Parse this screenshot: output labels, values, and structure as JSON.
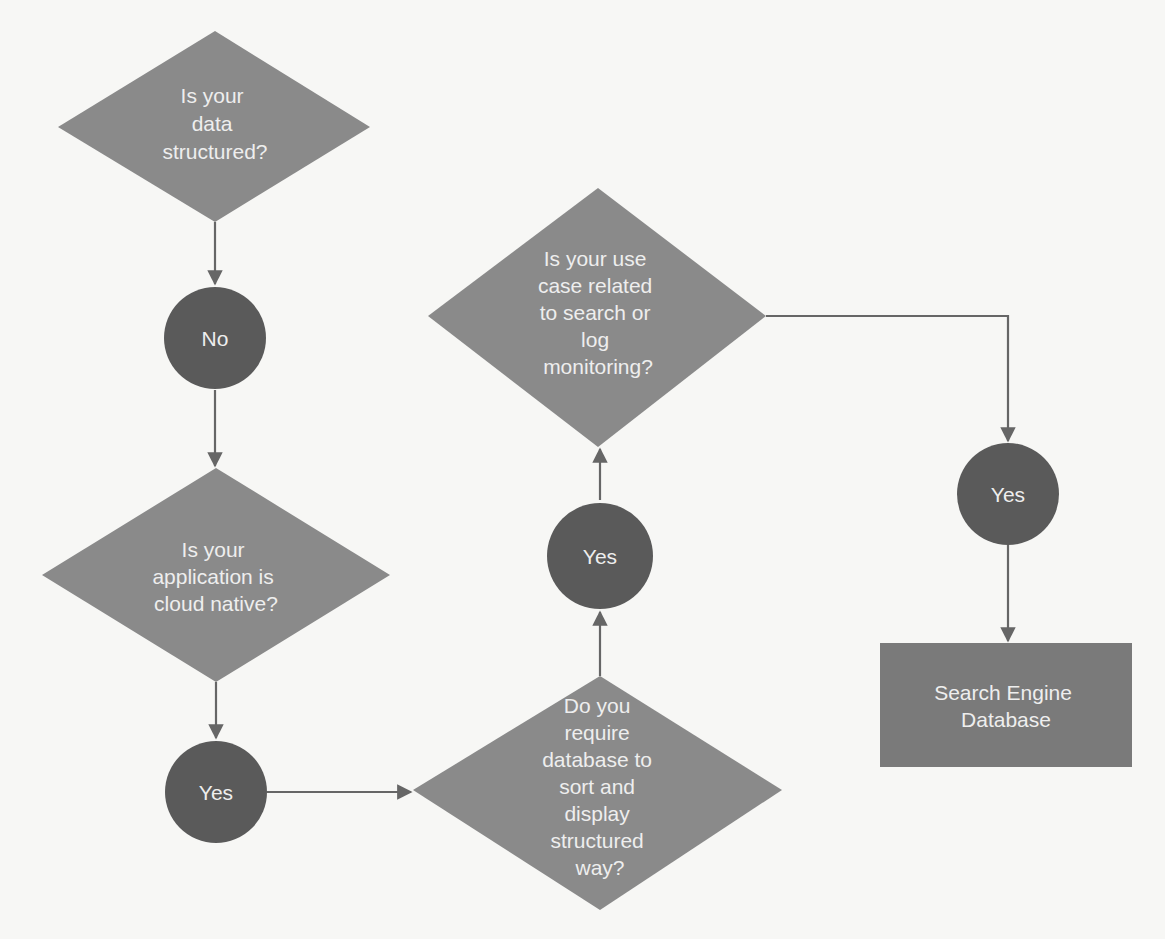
{
  "diagram": {
    "title": "",
    "colors": {
      "decision_fill": "#8a8a8a",
      "answer_fill": "#5a5a5a",
      "result_fill": "#7a7a7a",
      "connector": "#666666",
      "text": "#eeeeee",
      "background": "#f7f7f5"
    },
    "nodes": {
      "q_structured": {
        "type": "decision",
        "lines": [
          "Is your",
          "data",
          "structured?"
        ]
      },
      "a_no": {
        "type": "answer",
        "label": "No"
      },
      "q_cloud_native": {
        "type": "decision",
        "lines": [
          "Is your",
          "application is",
          "cloud native?"
        ]
      },
      "a_yes_cloud": {
        "type": "answer",
        "label": "Yes"
      },
      "q_sort_display": {
        "type": "decision",
        "lines": [
          "Do you",
          "require",
          "database to",
          "sort and",
          "display",
          "structured",
          "way?"
        ]
      },
      "a_yes_sort": {
        "type": "answer",
        "label": "Yes"
      },
      "q_search_log": {
        "type": "decision",
        "lines": [
          "Is your use",
          "case related",
          "to search or",
          "log",
          "monitoring?"
        ]
      },
      "a_yes_search": {
        "type": "answer",
        "label": "Yes"
      },
      "r_search_engine": {
        "type": "result",
        "lines": [
          "Search Engine",
          "Database"
        ]
      }
    },
    "edges": [
      {
        "from": "q_structured",
        "to": "a_no"
      },
      {
        "from": "a_no",
        "to": "q_cloud_native"
      },
      {
        "from": "q_cloud_native",
        "to": "a_yes_cloud"
      },
      {
        "from": "a_yes_cloud",
        "to": "q_sort_display"
      },
      {
        "from": "q_sort_display",
        "to": "a_yes_sort"
      },
      {
        "from": "a_yes_sort",
        "to": "q_search_log"
      },
      {
        "from": "q_search_log",
        "to": "a_yes_search"
      },
      {
        "from": "a_yes_search",
        "to": "r_search_engine"
      }
    ]
  }
}
